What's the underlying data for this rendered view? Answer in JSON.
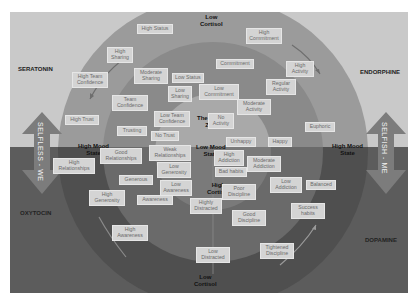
{
  "hormones": {
    "top_left": "SERATONIN",
    "top_right": "ENDORPHINE",
    "bottom_left": "OXYTOCIN",
    "bottom_right": "DOPAMINE"
  },
  "axes": {
    "left_arrow": "SELFLESS - WE",
    "right_arrow": "SELFISH - ME"
  },
  "zone_labels": {
    "top_cortisol": [
      "Low",
      "Cortisol"
    ],
    "bottom_cortisol": [
      "Low",
      "Cortisol"
    ],
    "center_cortisol": [
      "High",
      "Cortisol"
    ],
    "stress_zone": [
      "The Stress",
      "Zone"
    ],
    "low_mood": [
      "Low Mood",
      "State"
    ],
    "high_mood_left": [
      "High Mood",
      "State"
    ],
    "high_mood_right": [
      "High Mood",
      "State"
    ]
  },
  "boxes": [
    {
      "id": "high-status",
      "text": [
        "High Status"
      ],
      "x": 137,
      "y": 24,
      "w": 36
    },
    {
      "id": "high-commitment",
      "text": [
        "High",
        "Commitment"
      ],
      "x": 246,
      "y": 28,
      "w": 36
    },
    {
      "id": "high-sharing",
      "text": [
        "High",
        "Sharing"
      ],
      "x": 107,
      "y": 47,
      "w": 26
    },
    {
      "id": "high-activity",
      "text": [
        "High",
        "Activity"
      ],
      "x": 286,
      "y": 61,
      "w": 28
    },
    {
      "id": "high-team-confidence",
      "text": [
        "High Team",
        "Confidence"
      ],
      "x": 72,
      "y": 72,
      "w": 36
    },
    {
      "id": "moderate-sharing",
      "text": [
        "Moderate",
        "Sharing"
      ],
      "x": 134,
      "y": 68,
      "w": 34
    },
    {
      "id": "low-status",
      "text": [
        "Low Status"
      ],
      "x": 172,
      "y": 73,
      "w": 30
    },
    {
      "id": "commitment",
      "text": [
        "Commitment"
      ],
      "x": 216,
      "y": 59,
      "w": 38
    },
    {
      "id": "low-sharing",
      "text": [
        "Low",
        "Sharing"
      ],
      "x": 168,
      "y": 86,
      "w": 24
    },
    {
      "id": "low-commitment",
      "text": [
        "Low",
        "Commitment"
      ],
      "x": 199,
      "y": 84,
      "w": 40
    },
    {
      "id": "regular-activity",
      "text": [
        "Regular",
        "Activity"
      ],
      "x": 266,
      "y": 79,
      "w": 30
    },
    {
      "id": "team-confidence",
      "text": [
        "Team",
        "Confidence"
      ],
      "x": 112,
      "y": 95,
      "w": 36
    },
    {
      "id": "moderate-activity",
      "text": [
        "Moderate",
        "Activity"
      ],
      "x": 237,
      "y": 99,
      "w": 34
    },
    {
      "id": "low-team-confidence",
      "text": [
        "Low Team",
        "Confidence"
      ],
      "x": 154,
      "y": 111,
      "w": 36
    },
    {
      "id": "no-activity",
      "text": [
        "No",
        "Activity"
      ],
      "x": 208,
      "y": 113,
      "w": 26
    },
    {
      "id": "high-trust",
      "text": [
        "High Trust"
      ],
      "x": 65,
      "y": 115,
      "w": 34
    },
    {
      "id": "euphoric",
      "text": [
        "Euphoric"
      ],
      "x": 305,
      "y": 122,
      "w": 30
    },
    {
      "id": "trusting",
      "text": [
        "Trusting"
      ],
      "x": 117,
      "y": 126,
      "w": 30
    },
    {
      "id": "no-trust",
      "text": [
        "No Trust"
      ],
      "x": 151,
      "y": 131,
      "w": 28
    },
    {
      "id": "unhappy",
      "text": [
        "Unhappy"
      ],
      "x": 226,
      "y": 137,
      "w": 30
    },
    {
      "id": "happy",
      "text": [
        "Happy"
      ],
      "x": 268,
      "y": 137,
      "w": 24
    },
    {
      "id": "weak-relationships",
      "text": [
        "Weak",
        "Relationships"
      ],
      "x": 149,
      "y": 145,
      "w": 42
    },
    {
      "id": "good-relationships",
      "text": [
        "Good",
        "Relationships"
      ],
      "x": 100,
      "y": 148,
      "w": 42
    },
    {
      "id": "high-addiction",
      "text": [
        "High",
        "Addiction"
      ],
      "x": 214,
      "y": 150,
      "w": 30
    },
    {
      "id": "high-relationships",
      "text": [
        "High",
        "Relationships"
      ],
      "x": 53,
      "y": 158,
      "w": 42
    },
    {
      "id": "low-generosity",
      "text": [
        "Low",
        "Generosity"
      ],
      "x": 157,
      "y": 162,
      "w": 34
    },
    {
      "id": "moderate-addiction",
      "text": [
        "Moderate",
        "Addiction"
      ],
      "x": 247,
      "y": 156,
      "w": 34
    },
    {
      "id": "bad-habits",
      "text": [
        "Bad habits"
      ],
      "x": 215,
      "y": 167,
      "w": 32
    },
    {
      "id": "generous",
      "text": [
        "Generous"
      ],
      "x": 119,
      "y": 175,
      "w": 34
    },
    {
      "id": "low-awareness",
      "text": [
        "Low",
        "Awareness"
      ],
      "x": 160,
      "y": 180,
      "w": 32
    },
    {
      "id": "low-addiction",
      "text": [
        "Low",
        "Addiction"
      ],
      "x": 270,
      "y": 177,
      "w": 32
    },
    {
      "id": "balanced",
      "text": [
        "Balanced"
      ],
      "x": 306,
      "y": 180,
      "w": 30
    },
    {
      "id": "poor-discipline",
      "text": [
        "Poor",
        "Discipline"
      ],
      "x": 222,
      "y": 184,
      "w": 34
    },
    {
      "id": "high-generosity",
      "text": [
        "High",
        "Generosity"
      ],
      "x": 89,
      "y": 190,
      "w": 36
    },
    {
      "id": "awareness",
      "text": [
        "Awareness"
      ],
      "x": 137,
      "y": 195,
      "w": 36
    },
    {
      "id": "highly-distracted",
      "text": [
        "Highly",
        "Distracted"
      ],
      "x": 190,
      "y": 198,
      "w": 32
    },
    {
      "id": "success-habits",
      "text": [
        "Success",
        "habits"
      ],
      "x": 291,
      "y": 203,
      "w": 34
    },
    {
      "id": "good-discipline",
      "text": [
        "Good",
        "Discipline"
      ],
      "x": 232,
      "y": 210,
      "w": 34
    },
    {
      "id": "high-awareness",
      "text": [
        "High",
        "Awareness"
      ],
      "x": 112,
      "y": 225,
      "w": 36
    },
    {
      "id": "low-distracted",
      "text": [
        "Low",
        "Distracted"
      ],
      "x": 196,
      "y": 247,
      "w": 34
    },
    {
      "id": "tightened-discipline",
      "text": [
        "Tightened",
        "Discipline"
      ],
      "x": 260,
      "y": 243,
      "w": 34
    }
  ],
  "colors": {
    "top_background": "#c9c9c9",
    "bottom_background": "#5c5c5c",
    "outer_ring": "#9a9a9a",
    "middle_ring": "#858585",
    "inner_zone": "#a8a8a8",
    "box_fill": "#d4d4d4",
    "arrow_fill": "#7a7a7a"
  }
}
